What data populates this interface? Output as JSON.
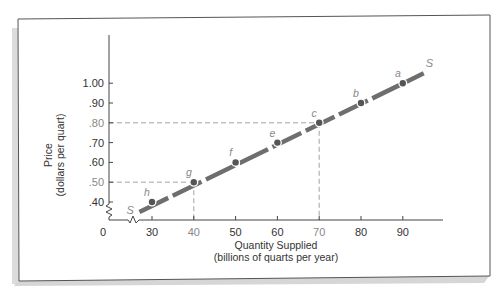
{
  "chart_data": {
    "type": "line",
    "title": "",
    "xlabel": "Quantity Supplied",
    "xlabel_sub": "(billions of quarts per year)",
    "ylabel": "Price",
    "ylabel_sub": "(dollars per quart)",
    "origin_label": "0",
    "xlim": [
      25,
      98
    ],
    "ylim": [
      0.33,
      1.25
    ],
    "x_ticks": [
      30,
      40,
      50,
      60,
      70,
      80,
      90
    ],
    "x_tick_labels": [
      "30",
      "40",
      "50",
      "60",
      "70",
      "80",
      "90"
    ],
    "y_ticks": [
      0.4,
      0.5,
      0.6,
      0.7,
      0.8,
      0.9,
      1.0
    ],
    "y_tick_labels": [
      ".40",
      ".50",
      ".60",
      ".70",
      ".80",
      ".90",
      "1.00"
    ],
    "axis_breaks": true,
    "grid": false,
    "legend": "none",
    "series": [
      {
        "name": "S",
        "label_start": "S",
        "label_end": "S",
        "line_style": "thick dashed",
        "color": "#6b6b6b",
        "x": [
          27,
          95
        ],
        "y": [
          0.35,
          1.05
        ]
      }
    ],
    "points": [
      {
        "label": "h",
        "x": 30,
        "y": 0.4
      },
      {
        "label": "g",
        "x": 40,
        "y": 0.5
      },
      {
        "label": "f",
        "x": 50,
        "y": 0.6
      },
      {
        "label": "e",
        "x": 60,
        "y": 0.7
      },
      {
        "label": "c",
        "x": 70,
        "y": 0.8
      },
      {
        "label": "b",
        "x": 80,
        "y": 0.9
      },
      {
        "label": "a",
        "x": 90,
        "y": 1.0
      }
    ],
    "reference_lines": [
      {
        "from_point": "g",
        "x": 40,
        "y": 0.5,
        "style": "dashed"
      },
      {
        "from_point": "c",
        "x": 70,
        "y": 0.8,
        "style": "dashed"
      }
    ],
    "highlighted_tick_labels": [
      "40",
      "70",
      ".50",
      ".80"
    ]
  },
  "colors": {
    "frame": "#555555",
    "shadow": "#d9d9d9",
    "axis": "#444444",
    "text": "#333333",
    "highlight_text": "#888888",
    "curve": "#6e6e6e",
    "dash_ref": "#8a8a8a"
  }
}
